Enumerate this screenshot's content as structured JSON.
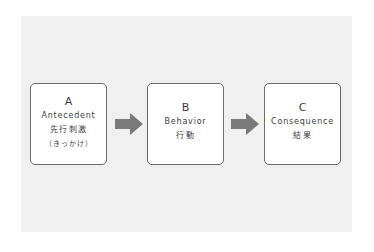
{
  "diagram": {
    "colors": {
      "background": "#ffffff",
      "panel": "#f0f0f0",
      "box_fill": "#ffffff",
      "box_border": "#6b6b6b",
      "arrow": "#7a7a7a",
      "text": "#3c3c3c"
    },
    "boxes": [
      {
        "letter": "A",
        "english": "Antecedent",
        "japanese": "先行刺激",
        "japanese_note": "（きっかけ）"
      },
      {
        "letter": "B",
        "english": "Behavior",
        "japanese": "行動"
      },
      {
        "letter": "C",
        "english": "Consequence",
        "japanese": "結果"
      }
    ],
    "arrows": [
      {
        "from": "A",
        "to": "B",
        "icon": "right-arrow-icon"
      },
      {
        "from": "B",
        "to": "C",
        "icon": "right-arrow-icon"
      }
    ]
  }
}
